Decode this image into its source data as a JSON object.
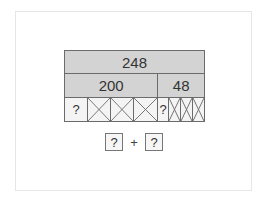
{
  "diagram": {
    "total": "248",
    "parts": [
      {
        "label": "200",
        "width": 94
      },
      {
        "label": "48",
        "width": 48
      }
    ],
    "units": [
      {
        "type": "question",
        "label": "?",
        "width": 24
      },
      {
        "type": "crossed",
        "width": 24
      },
      {
        "type": "crossed",
        "width": 24
      },
      {
        "type": "crossed",
        "width": 25
      },
      {
        "type": "question",
        "label": "?",
        "width": 12
      },
      {
        "type": "crossed",
        "width": 12
      },
      {
        "type": "crossed",
        "width": 12
      },
      {
        "type": "crossed",
        "width": 13
      }
    ],
    "colors": {
      "filled": "#d3d3d3",
      "border": "#6b6b6b",
      "empty": "#f4f4f4"
    }
  },
  "answer": {
    "box1": "?",
    "operator": "+",
    "box2": "?"
  }
}
